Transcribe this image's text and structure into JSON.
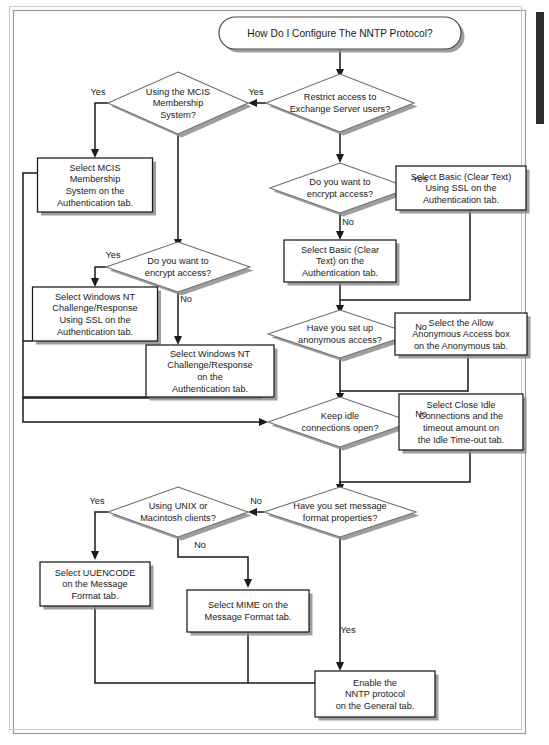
{
  "page": {
    "title": "How Do I Configure The NNTP Protocol?",
    "width": 549,
    "height": 745,
    "background": "#ffffff",
    "border_color": "#9a9a9a"
  },
  "chart_data": {
    "type": "diagram",
    "diagram_kind": "flowchart",
    "title": "How Do I Configure The NNTP Protocol?",
    "colors": {
      "node_fill": "#ffffff",
      "node_stroke": "#1a1a1a",
      "diamond_stroke": "#6f6f6f",
      "shadow": "#8d8d8d",
      "connector": "#1a1a1a"
    },
    "nodes": [
      {
        "id": "start",
        "shape": "terminator",
        "text": "How Do I Configure The NNTP Protocol?",
        "x": 340,
        "y": 33,
        "w": 242,
        "h": 32
      },
      {
        "id": "d_restrict",
        "shape": "diamond",
        "text": "Restrict access to\nExchange Server users?",
        "x": 340,
        "y": 103,
        "w": 148,
        "h": 58
      },
      {
        "id": "d_mcis",
        "shape": "diamond",
        "text": "Using the MCIS\nMembership\nSystem?",
        "x": 178,
        "y": 103,
        "w": 140,
        "h": 62
      },
      {
        "id": "b_mcis",
        "shape": "box",
        "text": "Select MCIS\nMembership\nSystem on the\nAuthentication tab.",
        "x": 95,
        "y": 185,
        "w": 115,
        "h": 54
      },
      {
        "id": "d_encrypt_left",
        "shape": "diamond",
        "text": "Do you want to\nencrypt access?",
        "x": 178,
        "y": 267,
        "w": 144,
        "h": 50
      },
      {
        "id": "b_ntssl",
        "shape": "box",
        "text": "Select Windows NT\nChallenge/Response\nUsing SSL on the\nAuthentication tab.",
        "x": 95,
        "y": 314,
        "w": 125,
        "h": 54
      },
      {
        "id": "b_nt",
        "shape": "box",
        "text": "Select  Windows NT\nChallenge/Response\non the\nAuthentication tab.",
        "x": 210,
        "y": 371,
        "w": 128,
        "h": 52
      },
      {
        "id": "d_encrypt_right",
        "shape": "diamond",
        "text": "Do you want to\nencrypt access?",
        "x": 340,
        "y": 188,
        "w": 140,
        "h": 50
      },
      {
        "id": "b_basicssl",
        "shape": "box",
        "text": "Select Basic (Clear Text)\nUsing SSL on the\nAuthentication tab.",
        "x": 461,
        "y": 188,
        "w": 130,
        "h": 44
      },
      {
        "id": "b_basic",
        "shape": "box",
        "text": "Select Basic (Clear\nText) on the\nAuthentication tab.",
        "x": 340,
        "y": 261,
        "w": 112,
        "h": 42
      },
      {
        "id": "d_anon",
        "shape": "diamond",
        "text": "Have you set up\nanonymous access?",
        "x": 340,
        "y": 334,
        "w": 144,
        "h": 48
      },
      {
        "id": "b_anon",
        "shape": "box",
        "text": "Select the Allow\nAnonymous Access box\non the Anonymous tab.",
        "x": 461,
        "y": 334,
        "w": 132,
        "h": 42
      },
      {
        "id": "d_idle",
        "shape": "diamond",
        "text": "Keep idle\nconnections open?",
        "x": 340,
        "y": 422,
        "w": 144,
        "h": 50
      },
      {
        "id": "b_idle",
        "shape": "box",
        "text": "Select Close Idle\nConnections and the\ntimeout amount on\nthe Idle Time-out tab.",
        "x": 461,
        "y": 422,
        "w": 124,
        "h": 56
      },
      {
        "id": "d_msgfmt",
        "shape": "diamond",
        "text": "Have you set message\nformat properties?",
        "x": 340,
        "y": 512,
        "w": 152,
        "h": 50
      },
      {
        "id": "d_unix",
        "shape": "diamond",
        "text": "Using UNIX or\nMacintosh clients?",
        "x": 178,
        "y": 512,
        "w": 140,
        "h": 50
      },
      {
        "id": "b_uuencode",
        "shape": "box",
        "text": "Select UUENCODE\non the Message\nFormat tab.",
        "x": 95,
        "y": 584,
        "w": 110,
        "h": 44
      },
      {
        "id": "b_mime",
        "shape": "box",
        "text": "Select MIME on the\nMessage Format tab.",
        "x": 248,
        "y": 611,
        "w": 122,
        "h": 42
      },
      {
        "id": "b_enable",
        "shape": "box",
        "text": "Enable the\nNNTP protocol\non the General tab.",
        "x": 375,
        "y": 694,
        "w": 120,
        "h": 46
      }
    ],
    "edge_labels": [
      {
        "text": "Yes",
        "x": 256,
        "y": 95
      },
      {
        "text": "Yes",
        "x": 98,
        "y": 95
      },
      {
        "text": "Yes",
        "x": 113,
        "y": 258
      },
      {
        "text": "No",
        "x": 186,
        "y": 302
      },
      {
        "text": "Yes",
        "x": 420,
        "y": 182
      },
      {
        "text": "No",
        "x": 348,
        "y": 225
      },
      {
        "text": "No",
        "x": 421,
        "y": 330
      },
      {
        "text": "No",
        "x": 421,
        "y": 417
      },
      {
        "text": "No",
        "x": 256,
        "y": 504
      },
      {
        "text": "Yes",
        "x": 97,
        "y": 504
      },
      {
        "text": "No",
        "x": 200,
        "y": 548
      },
      {
        "text": "Yes",
        "x": 348,
        "y": 633
      }
    ]
  }
}
